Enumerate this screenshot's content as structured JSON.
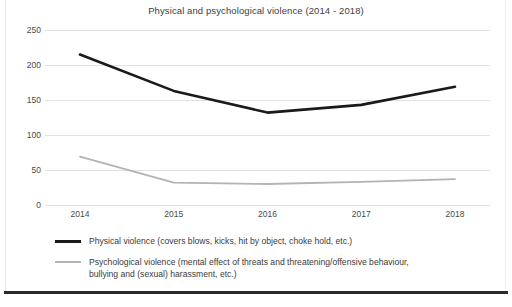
{
  "chart_data": {
    "type": "line",
    "title": "Physical and psychological violence (2014 - 2018)",
    "xlabel": "",
    "ylabel": "",
    "categories": [
      "2014",
      "2015",
      "2016",
      "2017",
      "2018"
    ],
    "series": [
      {
        "name": "Physical violence (covers blows,  kicks, hit by object, choke hold, etc.)",
        "short_name": "Physical violence",
        "color": "#1a1a1a",
        "values": [
          215,
          163,
          132,
          143,
          169
        ]
      },
      {
        "name": "Psychological violence (mental effect of threats and threatening/offensive behaviour, bullying and (sexual) harassment, etc.)",
        "short_name": "Psychological violence",
        "color": "#b3b3b3",
        "values": [
          69,
          32,
          30,
          33,
          37
        ]
      }
    ],
    "ylim": [
      0,
      250
    ],
    "yticks": [
      0,
      50,
      100,
      150,
      200,
      250
    ],
    "ytick_labels": [
      "0",
      "50",
      "100",
      "150",
      "200",
      "250"
    ],
    "grid": true,
    "legend_position": "bottom-left"
  },
  "legend": {
    "entries": [
      {
        "line1": "Physical violence (covers blows,  kicks, hit by object, choke hold, etc.)",
        "line2": ""
      },
      {
        "line1": "Psychological violence (mental effect of threats and threatening/offensive behaviour,",
        "line2": "bullying and (sexual) harassment, etc.)"
      }
    ]
  }
}
